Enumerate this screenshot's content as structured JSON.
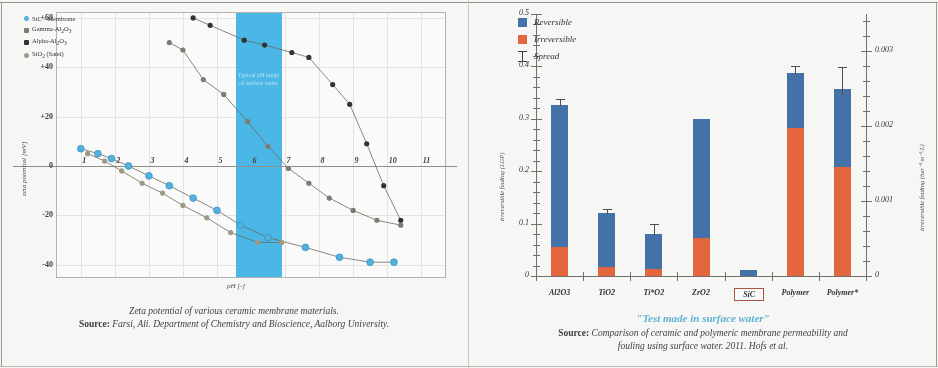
{
  "left_panel": {
    "caption_line1": "Zeta potential of various ceramic membrane materials.",
    "caption_source_label": "Source:",
    "caption_source_text": " Farsi, Ali. Department of Chemistry and Bioscience, Aalborg University.",
    "band_text": "Typical pH range of surface water",
    "colors": {
      "sic": "#4fb3e0",
      "gamma": "#7a7a6e",
      "alpha": "#2e2e2e",
      "sio2": "#9a9a86",
      "band": "#39b4ea"
    }
  },
  "right_panel": {
    "test_label": "\"Test made in surface water\"",
    "caption_source_label": "Source:",
    "caption_line1": " Comparison of ceramic and polymeric membrane permeability and",
    "caption_line2": "fouling using surface water. 2011. Hofs et al.",
    "colors": {
      "reversible": "#3f6fa8",
      "irreversible": "#e8633a",
      "highlight": "#a8503c",
      "accent": "#5bb4d8"
    }
  },
  "chart_data": [
    {
      "type": "line",
      "title": "Zeta potential of various ceramic membrane materials.",
      "xlabel": "pH [-]",
      "ylabel": "zeta potential [mV]",
      "xlim": [
        0.3,
        11.7
      ],
      "ylim": [
        -45,
        62
      ],
      "xticks": [
        "1",
        "2",
        "3",
        "4",
        "5",
        "6",
        "7",
        "8",
        "9",
        "10",
        "11"
      ],
      "xtick_values": [
        1,
        2,
        3,
        4,
        5,
        6,
        7,
        8,
        9,
        10,
        11
      ],
      "yticks": [
        "+60",
        "+40",
        "+20",
        "0",
        "-20",
        "-40"
      ],
      "ytick_values": [
        60,
        40,
        20,
        0,
        -20,
        -40
      ],
      "grid": true,
      "legend_position": "top-left",
      "shaded_band": {
        "label": "Typical pH range of surface water",
        "x_start": 5.55,
        "x_end": 6.9
      },
      "series": [
        {
          "name": "SiC - Membrane",
          "color": "#4fb3e0",
          "x": [
            1.0,
            1.5,
            1.9,
            2.4,
            3.0,
            3.6,
            4.3,
            5.0,
            5.7,
            6.5,
            7.6,
            8.6,
            9.5,
            10.2
          ],
          "y": [
            7,
            5,
            3,
            0,
            -4,
            -8,
            -13,
            -18,
            -24,
            -29,
            -33,
            -37,
            -39,
            -39
          ]
        },
        {
          "name": "Gamma-Al2O3",
          "color": "#7a7a6e",
          "x": [
            3.6,
            4.0,
            4.6,
            5.2,
            5.9,
            6.5,
            7.1,
            7.7,
            8.3,
            9.0,
            9.7,
            10.4
          ],
          "y": [
            50,
            47,
            35,
            29,
            18,
            8,
            -1,
            -7,
            -13,
            -18,
            -22,
            -24
          ]
        },
        {
          "name": "Alpha-Al2O3",
          "color": "#2e2e2e",
          "x": [
            4.3,
            4.8,
            5.8,
            6.4,
            7.2,
            7.7,
            8.4,
            8.9,
            9.4,
            9.9,
            10.4
          ],
          "y": [
            60,
            57,
            51,
            49,
            46,
            44,
            33,
            25,
            9,
            -8,
            -22
          ]
        },
        {
          "name": "SiO2 (Sand)",
          "color": "#9a9a86",
          "x": [
            1.2,
            1.7,
            2.2,
            2.8,
            3.4,
            4.0,
            4.7,
            5.4,
            6.2,
            6.9
          ],
          "y": [
            5,
            2,
            -2,
            -7,
            -11,
            -16,
            -21,
            -27,
            -31,
            -31
          ]
        }
      ]
    },
    {
      "type": "bar",
      "title": "\"Test made in surface water\"",
      "ylabel": "irreversible fouling (LGP)",
      "ylabel_right": "irreversible fouling (bar⁻¹ m⁻²/L)",
      "xlabel": "",
      "categories": [
        "Al2O3",
        "TiO2",
        "Ti*O2",
        "ZrO2",
        "SiC",
        "Polymer",
        "Polymer*"
      ],
      "highlight_category": "SiC",
      "ylim": [
        0,
        0.5
      ],
      "yticks": [
        "0",
        "0.1",
        "0.2",
        "0.3",
        "0.4",
        "0.5"
      ],
      "ytick_values": [
        0,
        0.1,
        0.2,
        0.3,
        0.4,
        0.5
      ],
      "ylim_right": [
        0,
        0.0035
      ],
      "yticks_right": [
        "0",
        "0.001",
        "0.002",
        "0.003"
      ],
      "ytick_values_right": [
        0,
        0.001,
        0.002,
        0.003
      ],
      "grid": false,
      "legend_position": "top-left",
      "legend": [
        "Reversible",
        "Irreversible",
        "Spread"
      ],
      "series": [
        {
          "name": "Irreversible",
          "color": "#e8633a",
          "values": [
            0.055,
            0.017,
            0.013,
            0.072,
            0.0,
            0.283,
            0.208
          ]
        },
        {
          "name": "Reversible",
          "color": "#3f6fa8",
          "values": [
            0.272,
            0.103,
            0.068,
            0.227,
            0.012,
            0.105,
            0.148
          ]
        }
      ],
      "totals": [
        0.327,
        0.12,
        0.081,
        0.299,
        0.012,
        0.388,
        0.356
      ],
      "spread": [
        0.011,
        0.008,
        0.018,
        0.0,
        0.0,
        0.012,
        0.042
      ]
    }
  ]
}
